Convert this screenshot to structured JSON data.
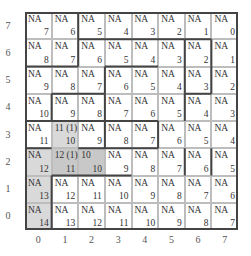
{
  "y_axis": [
    "7",
    "6",
    "5",
    "4",
    "3",
    "2",
    "1",
    "0"
  ],
  "x_axis": [
    "0",
    "1",
    "2",
    "3",
    "4",
    "5",
    "6",
    "7"
  ],
  "rows": [
    [
      {
        "tl": "NA",
        "br": "7"
      },
      {
        "tl": "NA",
        "br": "6"
      },
      {
        "tl": "NA",
        "br": "5"
      },
      {
        "tl": "NA",
        "br": "4"
      },
      {
        "tl": "NA",
        "br": "3"
      },
      {
        "tl": "NA",
        "br": "2"
      },
      {
        "tl": "NA",
        "br": "1"
      },
      {
        "tl": "NA",
        "br": "0"
      }
    ],
    [
      {
        "tl": "NA",
        "br": "8"
      },
      {
        "tl": "NA",
        "br": "7"
      },
      {
        "tl": "NA",
        "br": "6"
      },
      {
        "tl": "NA",
        "br": "5"
      },
      {
        "tl": "NA",
        "br": "4"
      },
      {
        "tl": "NA",
        "br": "3"
      },
      {
        "tl": "NA",
        "br": "2"
      },
      {
        "tl": "NA",
        "br": "1"
      }
    ],
    [
      {
        "tl": "NA",
        "br": "9"
      },
      {
        "tl": "NA",
        "br": "8"
      },
      {
        "tl": "NA",
        "br": "7"
      },
      {
        "tl": "NA",
        "br": "6"
      },
      {
        "tl": "NA",
        "br": "5"
      },
      {
        "tl": "NA",
        "br": "4"
      },
      {
        "tl": "NA",
        "br": "3"
      },
      {
        "tl": "NA",
        "br": "2"
      }
    ],
    [
      {
        "tl": "NA",
        "br": "10"
      },
      {
        "tl": "NA",
        "br": "9"
      },
      {
        "tl": "NA",
        "br": "8"
      },
      {
        "tl": "NA",
        "br": "7"
      },
      {
        "tl": "NA",
        "br": "6"
      },
      {
        "tl": "NA",
        "br": "5"
      },
      {
        "tl": "NA",
        "br": "4"
      },
      {
        "tl": "NA",
        "br": "3"
      }
    ],
    [
      {
        "tl": "NA",
        "br": "11"
      },
      {
        "tl": "11 (1)",
        "br": "10",
        "shade": "shade"
      },
      {
        "tl": "NA",
        "br": "9"
      },
      {
        "tl": "NA",
        "br": "8"
      },
      {
        "tl": "NA",
        "br": "7"
      },
      {
        "tl": "NA",
        "br": "6"
      },
      {
        "tl": "NA",
        "br": "5"
      },
      {
        "tl": "NA",
        "br": "4"
      }
    ],
    [
      {
        "tl": "NA",
        "br": "12",
        "shade": "shade"
      },
      {
        "tl": "12 (1)",
        "br": "11",
        "shade": "shade2"
      },
      {
        "tl": "10",
        "br": "10",
        "shade": "shade2"
      },
      {
        "tl": "NA",
        "br": "9"
      },
      {
        "tl": "NA",
        "br": "8"
      },
      {
        "tl": "NA",
        "br": "7"
      },
      {
        "tl": "NA",
        "br": "6"
      },
      {
        "tl": "NA",
        "br": "5"
      }
    ],
    [
      {
        "tl": "NA",
        "br": "13",
        "shade": "shade"
      },
      {
        "tl": "NA",
        "br": "12"
      },
      {
        "tl": "NA",
        "br": "11"
      },
      {
        "tl": "NA",
        "br": "10"
      },
      {
        "tl": "NA",
        "br": "9"
      },
      {
        "tl": "NA",
        "br": "8"
      },
      {
        "tl": "NA",
        "br": "7"
      },
      {
        "tl": "NA",
        "br": "6"
      }
    ],
    [
      {
        "tl": "NA",
        "br": "14",
        "shade": "shade"
      },
      {
        "tl": "NA",
        "br": "13"
      },
      {
        "tl": "NA",
        "br": "12"
      },
      {
        "tl": "NA",
        "br": "11"
      },
      {
        "tl": "NA",
        "br": "10"
      },
      {
        "tl": "NA",
        "br": "9"
      },
      {
        "tl": "NA",
        "br": "8"
      },
      {
        "tl": "NA",
        "br": "7"
      }
    ]
  ],
  "walls": [
    [
      2,
      0,
      2,
      2
    ],
    [
      2,
      1,
      6,
      1
    ],
    [
      6,
      1,
      7,
      1
    ],
    [
      6,
      1,
      6,
      3
    ],
    [
      7,
      1,
      7,
      3
    ],
    [
      0,
      2,
      2,
      2
    ],
    [
      3,
      2,
      5,
      2
    ],
    [
      3,
      2,
      3,
      3
    ],
    [
      1,
      3,
      3,
      3
    ],
    [
      1,
      3,
      1,
      4
    ],
    [
      0,
      4,
      1,
      4
    ],
    [
      3,
      3,
      3,
      4
    ],
    [
      6,
      3,
      7,
      3
    ],
    [
      6,
      3,
      6,
      4
    ],
    [
      3,
      4,
      5,
      4
    ],
    [
      1,
      4,
      3,
      4
    ],
    [
      5,
      4,
      5,
      5
    ],
    [
      3,
      4,
      3,
      5
    ],
    [
      3,
      5,
      5,
      5
    ],
    [
      0,
      5,
      1,
      5
    ],
    [
      2,
      5,
      3,
      5
    ],
    [
      7,
      5,
      7,
      6
    ],
    [
      1,
      6,
      4,
      6
    ],
    [
      1,
      6,
      1,
      8
    ],
    [
      6,
      5,
      6,
      6
    ],
    [
      4,
      6,
      4,
      6
    ]
  ]
}
